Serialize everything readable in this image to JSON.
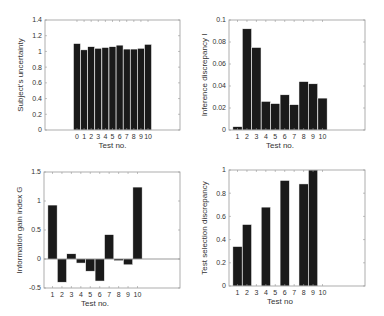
{
  "figure": {
    "width": 384,
    "height": 316,
    "background": "#ffffff",
    "bar_color": "#1a1a1a",
    "bar_edge": "#ffffff",
    "frame_color": "#999999"
  },
  "chart_data": [
    {
      "id": "subjects-uncertainty",
      "type": "bar",
      "title": "",
      "xlabel": "Test no.",
      "ylabel": "Subject's uncertainty",
      "categories": [
        "0",
        "1",
        "2",
        "3",
        "4",
        "5",
        "6",
        "7",
        "8",
        "9",
        "10"
      ],
      "x": [
        0,
        1,
        2,
        3,
        4,
        5,
        6,
        7,
        8,
        9,
        10
      ],
      "values": [
        1.1,
        1.02,
        1.06,
        1.04,
        1.05,
        1.06,
        1.08,
        1.03,
        1.03,
        1.04,
        1.09
      ],
      "xlim": [
        -4.5,
        14.5
      ],
      "ylim": [
        0,
        1.4
      ],
      "yticks": [
        0,
        0.2,
        0.4,
        0.6,
        0.8,
        1,
        1.2,
        1.4
      ],
      "ytick_labels": [
        "0",
        "0.2",
        "0.4",
        "0.6",
        "0.8",
        "1",
        "1.2",
        "1.4"
      ],
      "grid": false,
      "legend": null,
      "frame": {
        "x0": 45,
        "y0": 20,
        "x1": 180,
        "y1": 130
      }
    },
    {
      "id": "inference-discrepancy",
      "type": "bar",
      "title": "",
      "xlabel": "Test no.",
      "ylabel": "Inference discrepancy I",
      "categories": [
        "1",
        "2",
        "3",
        "4",
        "5",
        "6",
        "7",
        "8",
        "9",
        "10"
      ],
      "x": [
        1,
        2,
        3,
        4,
        5,
        6,
        7,
        8,
        9,
        10
      ],
      "values": [
        0.003,
        0.092,
        0.075,
        0.026,
        0.024,
        0.032,
        0.023,
        0.044,
        0.042,
        0.029
      ],
      "xlim": [
        0.1,
        14.5
      ],
      "ylim": [
        0,
        0.1
      ],
      "yticks": [
        0,
        0.02,
        0.04,
        0.06,
        0.08,
        0.1
      ],
      "ytick_labels": [
        "0",
        "0.02",
        "0.04",
        "0.06",
        "0.08",
        "0.1"
      ],
      "grid": false,
      "legend": null,
      "frame": {
        "x0": 229,
        "y0": 20,
        "x1": 365,
        "y1": 130
      }
    },
    {
      "id": "information-gain-index",
      "type": "bar",
      "title": "",
      "xlabel": "Test no.",
      "ylabel": "Information gain index G",
      "categories": [
        "1",
        "2",
        "3",
        "4",
        "5",
        "6",
        "7",
        "8",
        "9",
        "10"
      ],
      "x": [
        1,
        2,
        3,
        4,
        5,
        6,
        7,
        8,
        9,
        10
      ],
      "values": [
        0.93,
        -0.4,
        0.09,
        -0.07,
        -0.21,
        -0.38,
        0.42,
        -0.03,
        -0.1,
        1.24
      ],
      "xlim": [
        0.1,
        14.5
      ],
      "ylim": [
        -0.5,
        1.5
      ],
      "yticks": [
        -0.5,
        0,
        0.5,
        1,
        1.5
      ],
      "ytick_labels": [
        "-0.5",
        "0",
        "0.5",
        "1",
        "1.5"
      ],
      "grid": false,
      "legend": null,
      "frame": {
        "x0": 44,
        "y0": 172,
        "x1": 180,
        "y1": 288
      }
    },
    {
      "id": "test-selection-discrepancy",
      "type": "bar",
      "title": "",
      "xlabel": "Test no",
      "ylabel": "Test selection discrepancy",
      "categories": [
        "1",
        "2",
        "3",
        "4",
        "5",
        "6",
        "7",
        "8",
        "9",
        "10"
      ],
      "x": [
        1,
        2,
        3,
        4,
        5,
        6,
        7,
        8,
        9,
        10
      ],
      "values": [
        0.34,
        0.53,
        0,
        0.68,
        0,
        0.91,
        0,
        0.88,
        1.0,
        0
      ],
      "xlim": [
        0.1,
        14.5
      ],
      "ylim": [
        0,
        1
      ],
      "yticks": [
        0,
        0.2,
        0.4,
        0.6,
        0.8,
        1
      ],
      "ytick_labels": [
        "0",
        "0.2",
        "0.4",
        "0.6",
        "0.8",
        "1"
      ],
      "grid": false,
      "legend": null,
      "frame": {
        "x0": 229,
        "y0": 170,
        "x1": 365,
        "y1": 286
      }
    }
  ]
}
